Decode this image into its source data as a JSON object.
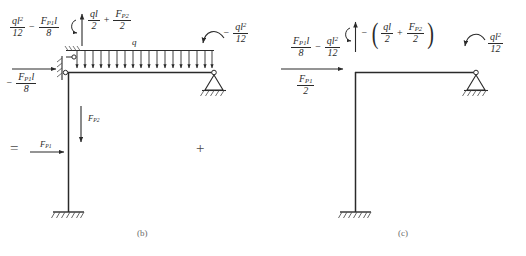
{
  "figure": {
    "title_domain": "structural-mechanics-free-body-diagram",
    "captions": {
      "b": "(b)",
      "c": "(c)"
    },
    "operators": {
      "equals": "=",
      "plus": "+"
    },
    "stroke_color": "#2a2a2a",
    "hatch_color": "#555555"
  },
  "panel_b": {
    "name": "panel-b",
    "labels": {
      "top_left_moment": {
        "term1_num": "ql",
        "term1_num_sup": "2",
        "term1_den": "12",
        "op": "−",
        "term2_num": "F",
        "term2_num_sub": "P1",
        "term2_num_tail": "l",
        "term2_den": "8"
      },
      "vertical_reaction": {
        "term1_num": "ql",
        "term1_den": "2",
        "op": "+",
        "term2_num": "F",
        "term2_num_sub": "P2",
        "term2_den": "2"
      },
      "right_moment": {
        "sign": "−",
        "num": "ql",
        "num_sup": "2",
        "den": "12"
      },
      "left_horizontal_moment": {
        "sign": "−",
        "num": "F",
        "num_sub": "P1",
        "num_tail": "l",
        "den": "8"
      },
      "distributed_load": "q",
      "force_h": {
        "sym": "F",
        "sub": "P1"
      },
      "force_v": {
        "sym": "F",
        "sub": "P2"
      }
    }
  },
  "panel_c": {
    "name": "panel-c",
    "labels": {
      "top_left_moment": {
        "term1_num": "F",
        "term1_num_sub": "P1",
        "term1_num_tail": "l",
        "term1_den": "8",
        "op": "−",
        "term2_num": "ql",
        "term2_num_sup": "2",
        "term2_den": "12"
      },
      "vertical_reaction": {
        "sign": "−",
        "open": "(",
        "term1_num": "ql",
        "term1_den": "2",
        "op": "+",
        "term2_num": "F",
        "term2_num_sub": "P2",
        "term2_den": "2",
        "close": ")"
      },
      "right_moment": {
        "num": "ql",
        "num_sup": "2",
        "den": "12"
      },
      "left_horizontal_force": {
        "num": "F",
        "num_sub": "P1",
        "den": "2"
      }
    }
  }
}
